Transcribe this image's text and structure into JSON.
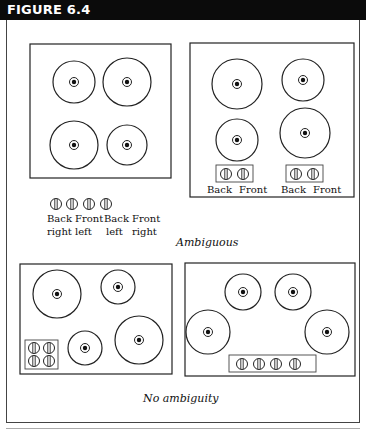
{
  "figure": {
    "title": "FIGURE 6.4",
    "colors": {
      "header_bg": "#0b0b0b",
      "header_text": "#ffffff",
      "line": "#222222"
    }
  },
  "captions": {
    "ambiguous": "Ambiguous",
    "no_ambiguity": "No ambiguity"
  },
  "panels": {
    "top_left": {
      "description": "Four burners in 2x2 grid, controls in a row below",
      "knob_labels": [
        {
          "line1": "Back",
          "line2": "right"
        },
        {
          "line1": "Front",
          "line2": "left"
        },
        {
          "line1": "Back",
          "line2": "left"
        },
        {
          "line1": "Front",
          "line2": "right"
        }
      ]
    },
    "top_right": {
      "description": "Four burners, two control groups",
      "group_labels": [
        [
          "Back",
          "Front"
        ],
        [
          "Back",
          "Front"
        ]
      ]
    },
    "bottom_left": {
      "description": "Four burners, controls in 2x2 block at bottom-left"
    },
    "bottom_right": {
      "description": "Four burners arranged in arc, controls in row at bottom"
    }
  }
}
